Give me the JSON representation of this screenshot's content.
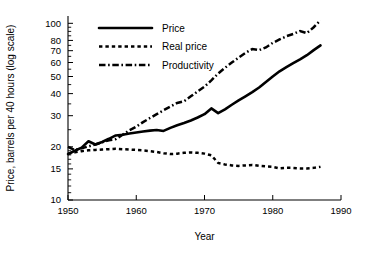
{
  "chart_data": {
    "type": "line",
    "title": "",
    "xlabel": "Year",
    "ylabel": "Price, barrels per 40 hours (log scale)",
    "yscale": "log",
    "xlim": [
      1950,
      1990
    ],
    "ylim": [
      10,
      110
    ],
    "grid": false,
    "legend_position": "top-left",
    "xticks": [
      1950,
      1960,
      1970,
      1980,
      1990
    ],
    "xticklabels": [
      "1950",
      "1960",
      "1970",
      "1980",
      "1990"
    ],
    "yticks": [
      10,
      15,
      20,
      30,
      40,
      50,
      60,
      70,
      80,
      100
    ],
    "yticklabels": [
      "10",
      "15",
      "20",
      "30",
      "40",
      "50",
      "60",
      "70",
      "80",
      "100"
    ],
    "x": [
      1950,
      1951,
      1952,
      1953,
      1954,
      1955,
      1956,
      1957,
      1958,
      1959,
      1960,
      1961,
      1962,
      1963,
      1964,
      1965,
      1966,
      1967,
      1968,
      1969,
      1970,
      1971,
      1972,
      1973,
      1974,
      1975,
      1976,
      1977,
      1978,
      1979,
      1980,
      1981,
      1982,
      1983,
      1984,
      1985,
      1986,
      1987
    ],
    "series": [
      {
        "name": "Price",
        "style": "solid",
        "values": [
          18.2,
          19.0,
          19.8,
          21.5,
          20.6,
          21.3,
          22.2,
          23.2,
          23.4,
          23.8,
          24.1,
          24.4,
          24.7,
          24.9,
          24.6,
          25.6,
          26.5,
          27.3,
          28.2,
          29.3,
          30.6,
          33.0,
          31.0,
          32.6,
          34.6,
          36.6,
          38.6,
          40.8,
          43.3,
          46.5,
          50.0,
          53.5,
          56.5,
          59.5,
          62.5,
          66.0,
          70.5,
          75.0
        ]
      },
      {
        "name": "Real price",
        "style": "dotted",
        "values": [
          18.3,
          18.6,
          18.9,
          19.1,
          19.2,
          19.3,
          19.4,
          19.5,
          19.4,
          19.3,
          19.2,
          19.1,
          18.9,
          18.7,
          18.4,
          18.2,
          18.3,
          18.5,
          18.6,
          18.5,
          18.3,
          17.9,
          16.2,
          15.9,
          15.7,
          15.6,
          15.7,
          15.8,
          15.6,
          15.5,
          15.4,
          15.1,
          15.2,
          15.2,
          15.1,
          15.1,
          15.2,
          15.4
        ]
      },
      {
        "name": "Productivity",
        "style": "dash-dot",
        "values": [
          20.0,
          19.2,
          19.6,
          20.1,
          20.6,
          21.2,
          21.8,
          22.1,
          23.4,
          24.8,
          26.0,
          27.6,
          29.1,
          30.6,
          32.2,
          33.8,
          35.4,
          36.2,
          38.6,
          41.2,
          43.8,
          47.5,
          52.0,
          56.0,
          60.0,
          64.0,
          68.0,
          71.5,
          70.5,
          73.0,
          77.5,
          81.0,
          84.5,
          87.0,
          90.5,
          88.0,
          95.0,
          104.0
        ]
      }
    ],
    "legend": [
      {
        "label": "Price",
        "style": "solid"
      },
      {
        "label": "Real price",
        "style": "dotted"
      },
      {
        "label": "Productivity",
        "style": "dash-dot"
      }
    ]
  }
}
